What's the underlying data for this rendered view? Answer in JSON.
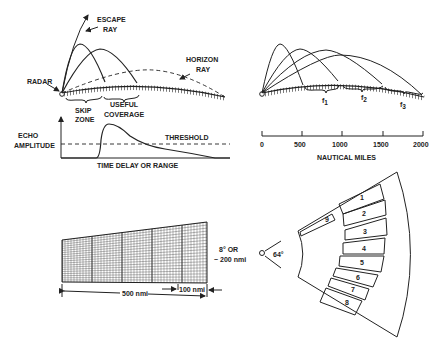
{
  "panel_a": {
    "labels": {
      "escape_ray_1": "ESCAPE",
      "escape_ray_2": "RAY",
      "horizon_ray_1": "HORIZON",
      "horizon_ray_2": "RAY",
      "radar": "RADAR",
      "skip_zone_1": "SKIP",
      "skip_zone_2": "ZONE",
      "useful_coverage_1": "USEFUL",
      "useful_coverage_2": "COVERAGE",
      "echo_amplitude_1": "ECHO",
      "echo_amplitude_2": "AMPLITUDE",
      "threshold": "THRESHOLD",
      "x_axis": "TIME DELAY OR RANGE"
    }
  },
  "panel_b": {
    "frequency_labels": [
      "f",
      "f",
      "f"
    ],
    "frequency_subscripts": [
      "1",
      "2",
      "3"
    ],
    "scale_ticks": [
      "0",
      "500",
      "1000",
      "1500",
      "2000"
    ],
    "scale_label": "NAUTICAL MILES"
  },
  "panel_c": {
    "angle_label_1": "8° OR",
    "angle_label_2": "~ 200 nmi",
    "range_label": "500 nmi",
    "cell_label": "100 nmi"
  },
  "panel_d": {
    "angle_label": "64°",
    "beam_numbers": [
      "1",
      "2",
      "3",
      "4",
      "5",
      "6",
      "7",
      "8",
      "9"
    ]
  }
}
